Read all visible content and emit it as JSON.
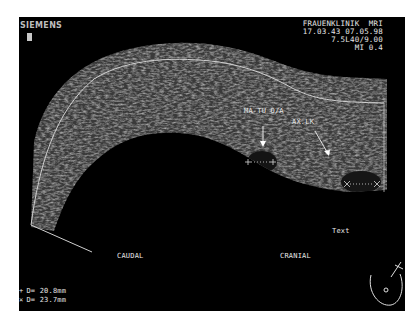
{
  "device": {
    "brand": "SIEMENS",
    "institution": "FRAUENKLINIK  MRI",
    "datetime": "17.03.43 07.05.98",
    "transducer": "7.5L40/9.00",
    "mechanical_index": "MI 0.4"
  },
  "annotations": {
    "lesion_label": "MA-TU O/A",
    "lymph_node_label": "AX.LK",
    "text_label": "Text",
    "caudal": "CAUDAL",
    "cranial": "CRANIAL"
  },
  "measurements": [
    {
      "marker": "+",
      "symbol_name": "plus-caliper",
      "label": "D= 20.8mm"
    },
    {
      "marker": "×",
      "symbol_name": "x-caliper",
      "label": "D= 23.7mm"
    }
  ],
  "colors": {
    "background": "#000000",
    "text": "#e6e6e6",
    "outline": "#d0d0d0"
  }
}
